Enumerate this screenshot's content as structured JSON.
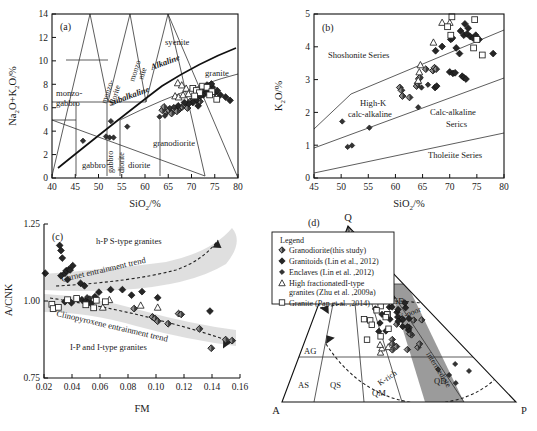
{
  "figure": {
    "panels": [
      "(a)",
      "(b)",
      "(c)",
      "(d)"
    ]
  },
  "panel_a": {
    "tag": "(a)",
    "xlabel": "SiO₂/%",
    "ylabel": "Na₂O+K₂O/%",
    "xticks": [
      "40",
      "45",
      "50",
      "55",
      "60",
      "65",
      "70",
      "75",
      "80"
    ],
    "yticks": [
      "0",
      "2",
      "4",
      "6",
      "8",
      "10",
      "12",
      "14"
    ],
    "fields": [
      {
        "name": "monzo-gabbro-field",
        "text": "monzo-",
        "text2": "gabbro"
      },
      {
        "name": "monzodiorite-field",
        "text": "monzo-"
      },
      {
        "name": "monzonite-field",
        "text": "monzo"
      },
      {
        "name": "syenite-field",
        "text": "syenite"
      },
      {
        "name": "granite-field",
        "text": "granite"
      },
      {
        "name": "granodiorite-field",
        "text": "granodiorite"
      },
      {
        "name": "gabbro-field",
        "text": "gabbro"
      },
      {
        "name": "gabbro-diorite-field",
        "text": "gabbro"
      },
      {
        "name": "diorite-field",
        "text": "diorite"
      }
    ],
    "labels": {
      "alkaline": "Alkaline",
      "subalkaline": "Subalkaline",
      "syenite": "syenite",
      "granite": "granite",
      "granodiorite": "granodiorite",
      "monzo_gabbro_1": "monzo-",
      "monzo_gabbro_2": "gabbro",
      "monzo_diorite_1": "monzo-",
      "monzo_diorite_2": "diorite",
      "monzo_nite_1": "monzo",
      "monzo_nite_2": "nite",
      "gabbro": "gabbro",
      "gabbro_diorite_1": "gabbro",
      "gabbro_diorite_2": "diorite",
      "diorite": "diorite"
    }
  },
  "panel_b": {
    "tag": "(b)",
    "xlabel": "SiO₂/%",
    "ylabel": "K₂O/%",
    "xticks": [
      "45",
      "50",
      "55",
      "60",
      "65",
      "70",
      "75",
      "80"
    ],
    "yticks": [
      "0",
      "1",
      "2",
      "3",
      "4",
      "5"
    ],
    "labels": {
      "shoshonite": "Shoshonite Series",
      "highk_1": "High-K",
      "highk_2": "calc-alkaline",
      "calcalk_1": "Calc-alkaline",
      "calcalk_2": "Serics",
      "tholeiite": "Tholeiite Series"
    }
  },
  "panel_c": {
    "tag": "(c)",
    "xlabel": "FM",
    "ylabel": "A/CNK",
    "xticks": [
      "0.02",
      "0.04",
      "0.06",
      "0.08",
      "0.10",
      "0.12",
      "0.14",
      "0.16"
    ],
    "yticks": [
      "0.75",
      "1.00",
      "1.25"
    ],
    "labels": {
      "top_field": "h-P S-type granites",
      "bottom_field": "I-P and I-type granites",
      "garnet_trend": "Garnet entrainment trend",
      "cpx_trend": "Clinopyroxene entrainment trend"
    }
  },
  "panel_d": {
    "tag": "(d)",
    "apex_q": "Q",
    "apex_a": "A",
    "apex_p": "P",
    "fields": {
      "sg": "SG",
      "mg": "MG",
      "gd": "GD",
      "qd": "QD",
      "ag": "AG",
      "as": "AS",
      "qs": "QS",
      "qm": "QM"
    },
    "curve_labels": {
      "k_poor": "K-poor",
      "intermediate": "intermediate",
      "k_rich": "K-rich"
    },
    "legend": {
      "title": "Legend",
      "items": [
        {
          "symbol": "granodiorite-marker",
          "label": "Granodiorite(this study)"
        },
        {
          "symbol": "granitoids-marker",
          "label": "Granitoids (Lin et al., 2012)"
        },
        {
          "symbol": "enclaves-marker",
          "label": "Enclaves (Lin et al. ,2012)"
        },
        {
          "symbol": "high-fractionated-marker",
          "label": "High fractionatedI-type",
          "label2": "granites (Zhu et al. ,2009a)"
        },
        {
          "symbol": "granite-marker",
          "label": "Granite (Pan et al. ,2014)"
        }
      ]
    }
  },
  "chart_data": [
    {
      "type": "scatter",
      "id": "a",
      "title": "TAS diagram",
      "xlabel": "SiO2/%",
      "ylabel": "Na2O+K2O/%",
      "xlim": [
        38,
        80
      ],
      "ylim": [
        0,
        15
      ],
      "series": [
        {
          "name": "Granodiorite(this study)",
          "marker": "diamond-half",
          "points": [
            [
              66.8,
              6.3
            ],
            [
              67.4,
              6.5
            ],
            [
              68.0,
              6.7
            ],
            [
              68.6,
              6.4
            ],
            [
              69.2,
              7.0
            ],
            [
              63.8,
              6.0
            ],
            [
              64.4,
              6.2
            ],
            [
              65.0,
              5.9
            ],
            [
              65.6,
              6.3
            ],
            [
              66.2,
              6.1
            ],
            [
              62.9,
              6.2
            ],
            [
              63.3,
              6.5
            ],
            [
              70.1,
              7.2
            ],
            [
              70.8,
              7.4
            ],
            [
              71.4,
              7.0
            ]
          ]
        },
        {
          "name": "Granitoids (Lin et al., 2012)",
          "marker": "diamond-filled",
          "points": [
            [
              72.2,
              7.6
            ],
            [
              72.8,
              7.9
            ],
            [
              73.3,
              8.1
            ],
            [
              73.8,
              7.7
            ],
            [
              74.2,
              8.3
            ],
            [
              74.8,
              7.8
            ],
            [
              75.3,
              8.0
            ],
            [
              71.5,
              7.5
            ],
            [
              70.6,
              7.1
            ],
            [
              69.8,
              6.9
            ],
            [
              76.0,
              7.6
            ],
            [
              77.2,
              7.4
            ],
            [
              78.2,
              7.1
            ],
            [
              73.0,
              8.5
            ],
            [
              74.0,
              8.6
            ],
            [
              72.5,
              8.2
            ],
            [
              71.0,
              6.6
            ],
            [
              68.9,
              6.8
            ],
            [
              67.9,
              6.9
            ],
            [
              66.5,
              6.6
            ]
          ]
        },
        {
          "name": "Enclaves (Lin et al. ,2012)",
          "marker": "diamond-small",
          "points": [
            [
              45.0,
              3.4
            ],
            [
              50.2,
              3.8
            ],
            [
              51.0,
              3.7
            ],
            [
              51.9,
              3.7
            ],
            [
              51.3,
              5.2
            ],
            [
              55.0,
              4.7
            ],
            [
              62.3,
              5.6
            ],
            [
              63.5,
              5.7
            ],
            [
              64.6,
              6.4
            ],
            [
              65.5,
              6.5
            ]
          ]
        },
        {
          "name": "High fractionatedI-type granites (Zhu et al. ,2009a)",
          "marker": "triangle-open",
          "points": [
            [
              66.4,
              8.7
            ],
            [
              67.3,
              8.5
            ],
            [
              68.3,
              8.2
            ],
            [
              65.8,
              7.5
            ],
            [
              66.6,
              7.4
            ],
            [
              67.6,
              7.6
            ],
            [
              68.8,
              7.7
            ]
          ]
        },
        {
          "name": "Granite (Pan et al. ,2014)",
          "marker": "square-open",
          "points": [
            [
              69.8,
              8.2
            ],
            [
              70.6,
              8.0
            ],
            [
              71.3,
              7.8
            ],
            [
              72.0,
              8.4
            ],
            [
              73.0,
              8.3
            ],
            [
              74.1,
              7.9
            ],
            [
              75.2,
              7.2
            ],
            [
              73.6,
              7.6
            ],
            [
              70.2,
              7.5
            ]
          ]
        }
      ],
      "boundary_labels": [
        "Alkaline",
        "Subalkaline",
        "syenite",
        "granite",
        "granodiorite",
        "monzo-gabbro",
        "monzo-diorite",
        "monzonite",
        "gabbro",
        "gabbro diorite",
        "diorite"
      ]
    },
    {
      "type": "scatter",
      "id": "b",
      "title": "K2O vs SiO2",
      "xlabel": "SiO2/%",
      "ylabel": "K2O/%",
      "xlim": [
        45,
        80
      ],
      "ylim": [
        0,
        5.8
      ],
      "series": [
        {
          "name": "Granodiorite(this study)",
          "marker": "diamond-half",
          "points": [
            [
              60.8,
              3.2
            ],
            [
              61.1,
              3.1
            ],
            [
              61.3,
              2.9
            ],
            [
              62.6,
              2.85
            ],
            [
              63.9,
              3.25
            ],
            [
              64.1,
              3.35
            ],
            [
              64.3,
              3.5
            ],
            [
              64.5,
              3.55
            ],
            [
              65.6,
              3.85
            ],
            [
              66.9,
              3.8
            ],
            [
              67.2,
              3.9
            ],
            [
              67.5,
              3.85
            ]
          ]
        },
        {
          "name": "Granitoids (Lin et al., 2012)",
          "marker": "diamond-filled",
          "points": [
            [
              67.4,
              4.5
            ],
            [
              68.6,
              4.65
            ],
            [
              70.2,
              4.9
            ],
            [
              70.5,
              4.95
            ],
            [
              71.2,
              4.6
            ],
            [
              72.0,
              5.2
            ],
            [
              72.6,
              5.05
            ],
            [
              73.2,
              5.1
            ],
            [
              73.8,
              5.0
            ],
            [
              74.3,
              4.95
            ],
            [
              74.8,
              5.05
            ],
            [
              72.8,
              5.45
            ],
            [
              73.4,
              5.3
            ],
            [
              71.8,
              4.4
            ],
            [
              72.3,
              3.6
            ],
            [
              72.6,
              3.55
            ],
            [
              73.0,
              3.5
            ],
            [
              70.0,
              3.75
            ],
            [
              70.6,
              3.7
            ],
            [
              71.0,
              3.72
            ],
            [
              67.3,
              3.2
            ],
            [
              67.6,
              3.25
            ],
            [
              78.0,
              4.4
            ],
            [
              75.4,
              4.9
            ]
          ]
        },
        {
          "name": "Enclaves (Lin et al. ,2012)",
          "marker": "diamond-small",
          "points": [
            [
              50.2,
              2.0
            ],
            [
              51.2,
              1.1
            ],
            [
              52.0,
              1.15
            ],
            [
              55.2,
              1.78
            ],
            [
              64.2,
              2.5
            ],
            [
              66.0,
              3.3
            ],
            [
              64.8,
              3.2
            ]
          ]
        },
        {
          "name": "High fractionatedI-type granites (Zhu et al. ,2009a)",
          "marker": "triangle-open",
          "points": [
            [
              64.2,
              3.45
            ],
            [
              64.6,
              4.0
            ],
            [
              67.0,
              4.8
            ],
            [
              68.6,
              5.5
            ],
            [
              70.0,
              5.5
            ],
            [
              64.4,
              3.75
            ]
          ]
        },
        {
          "name": "Granite (Pan et al. ,2014)",
          "marker": "square-open",
          "points": [
            [
              70.4,
              5.7
            ],
            [
              70.2,
              5.05
            ],
            [
              69.6,
              5.35
            ],
            [
              74.6,
              5.6
            ],
            [
              75.0,
              4.9
            ],
            [
              74.4,
              4.6
            ],
            [
              76.0,
              4.35
            ]
          ]
        }
      ],
      "boundary_labels": [
        "Shoshonite Series",
        "High-K calc-alkaline",
        "Calc-alkaline Serics",
        "Tholeiite Series"
      ]
    },
    {
      "type": "scatter",
      "id": "c",
      "title": "A/CNK vs FM",
      "xlabel": "FM",
      "ylabel": "A/CNK",
      "xlim": [
        0.013,
        0.163
      ],
      "ylim": [
        0.72,
        1.33
      ],
      "series": [
        {
          "name": "Granodiorite(this study)",
          "marker": "diamond-half",
          "points": [
            [
              0.082,
              0.995
            ],
            [
              0.096,
              0.962
            ],
            [
              0.098,
              0.955
            ],
            [
              0.1,
              0.945
            ],
            [
              0.108,
              0.935
            ],
            [
              0.116,
              0.975
            ],
            [
              0.118,
              0.972
            ],
            [
              0.132,
              0.915
            ],
            [
              0.141,
              0.838
            ],
            [
              0.152,
              0.872
            ],
            [
              0.157,
              0.868
            ]
          ]
        },
        {
          "name": "Granitoids (Lin et al., 2012)",
          "marker": "diamond-filled",
          "points": [
            [
              0.014,
              1.135
            ],
            [
              0.025,
              1.245
            ],
            [
              0.026,
              1.225
            ],
            [
              0.027,
              1.195
            ],
            [
              0.026,
              1.125
            ],
            [
              0.029,
              1.135
            ],
            [
              0.03,
              1.145
            ],
            [
              0.032,
              1.15
            ],
            [
              0.033,
              1.148
            ],
            [
              0.031,
              1.11
            ],
            [
              0.035,
              1.165
            ],
            [
              0.041,
              1.095
            ],
            [
              0.044,
              1.085
            ],
            [
              0.029,
              1.022
            ],
            [
              0.034,
              1.018
            ],
            [
              0.042,
              1.03
            ],
            [
              0.045,
              1.025
            ],
            [
              0.047,
              1.02
            ],
            [
              0.049,
              1.015
            ],
            [
              0.052,
              1.042
            ],
            [
              0.055,
              1.06
            ],
            [
              0.064,
              1.07
            ],
            [
              0.073,
              1.07
            ],
            [
              0.08,
              1.048
            ],
            [
              0.088,
              1.062
            ],
            [
              0.1,
              1.038
            ],
            [
              0.14,
              0.985
            ]
          ]
        },
        {
          "name": "Enclaves (Lin et al. ,2012)",
          "marker": "diamond-small",
          "points": [
            [
              0.046,
              1.04
            ],
            [
              0.048,
              1.035
            ]
          ]
        },
        {
          "name": "High fractionatedI-type granites (Zhu et al. ,2009a)",
          "marker": "triangle-open",
          "points": [
            [
              0.058,
              1.0
            ],
            [
              0.063,
              1.03
            ],
            [
              0.087,
              1.008
            ],
            [
              0.1,
              1.0
            ]
          ]
        },
        {
          "name": "Granite (Pan et al. ,2014)",
          "marker": "square-open",
          "points": [
            [
              0.019,
              1.012
            ],
            [
              0.02,
              0.995
            ],
            [
              0.024,
              1.0
            ],
            [
              0.031,
              1.03
            ],
            [
              0.038,
              1.035
            ],
            [
              0.045,
              1.01
            ],
            [
              0.051,
              0.998
            ],
            [
              0.053,
              1.028
            ],
            [
              0.06,
              1.022
            ]
          ]
        }
      ],
      "boundary_labels": [
        "h-P S-type granites",
        "I-P and I-type granites",
        "Garnet entrainment trend",
        "Clinopyroxene entrainment trend"
      ]
    },
    {
      "type": "scatter",
      "id": "d",
      "title": "QAP ternary classification",
      "axes": [
        "Q",
        "A",
        "P"
      ],
      "fields": [
        "SG",
        "MG",
        "GD",
        "QD",
        "AG",
        "AS",
        "QS",
        "QM"
      ],
      "curves": [
        "K-poor",
        "intermediate",
        "K-rich"
      ],
      "series": [
        {
          "name": "Granodiorite(this study)",
          "marker": "diamond-half",
          "count": 14
        },
        {
          "name": "Granitoids (Lin et al., 2012)",
          "marker": "diamond-filled",
          "count": 22
        },
        {
          "name": "Enclaves (Lin et al. ,2012)",
          "marker": "diamond-small",
          "count": 5
        },
        {
          "name": "High fractionatedI-type granites (Zhu et al. ,2009a)",
          "marker": "triangle-open",
          "count": 4
        },
        {
          "name": "Granite (Pan et al. ,2014)",
          "marker": "square-open",
          "count": 11
        }
      ]
    }
  ]
}
